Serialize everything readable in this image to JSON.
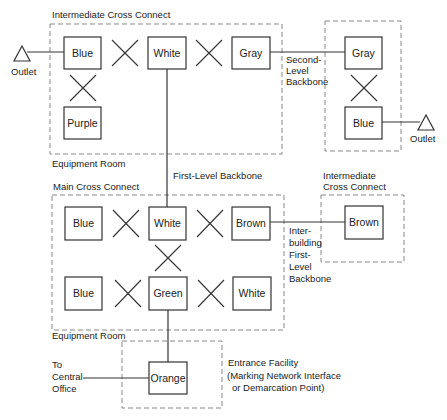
{
  "diagram": {
    "title_labels": {
      "top_icc": "Intermediate Cross Connect",
      "top_equipment_room": "Equipment Room",
      "first_level_backbone": "First-Level Backbone",
      "main_cross_connect": "Main Cross Connect",
      "right_icc_line1": "Intermediate",
      "right_icc_line2": "Cross Connect",
      "bottom_equipment_room": "Equipment Room",
      "second_level_line1": "Second-",
      "second_level_line2": "Level",
      "second_level_line3": "Backbone",
      "interbuilding_line1": "Inter-",
      "interbuilding_line2": "building",
      "interbuilding_line3": "First-",
      "interbuilding_line4": "Level",
      "interbuilding_line5": "Backbone",
      "to_co_line1": "To",
      "to_co_line2": "Central",
      "to_co_line3": "Office",
      "entrance_line1": "Entrance Facility",
      "entrance_line2": "(Marking Network Interface",
      "entrance_line3": "or Demarcation Point)",
      "outlet_left": "Outlet",
      "outlet_right": "Outlet"
    },
    "boxes": {
      "top_blue": "Blue",
      "top_white": "White",
      "top_gray": "Gray",
      "top_purple": "Purple",
      "right_gray": "Gray",
      "right_blue": "Blue",
      "main_blue1": "Blue",
      "main_white1": "White",
      "main_brown": "Brown",
      "main_blue2": "Blue",
      "main_green": "Green",
      "main_white2": "White",
      "icc2_brown": "Brown",
      "orange": "Orange"
    }
  }
}
